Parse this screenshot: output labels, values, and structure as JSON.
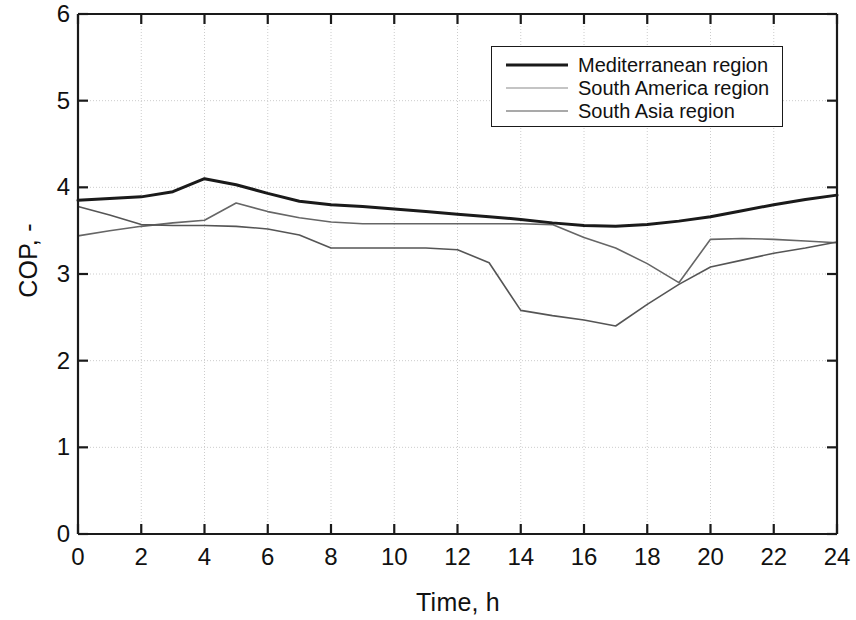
{
  "chart_data": {
    "type": "line",
    "title": "",
    "xlabel": "Time, h",
    "ylabel": "COP, -",
    "xlim": [
      0,
      24
    ],
    "ylim": [
      0,
      6
    ],
    "xticks": [
      "0",
      "2",
      "4",
      "6",
      "8",
      "10",
      "12",
      "14",
      "16",
      "18",
      "20",
      "22",
      "24"
    ],
    "xtick_values": [
      0,
      2,
      4,
      6,
      8,
      10,
      12,
      14,
      16,
      18,
      20,
      22,
      24
    ],
    "yticks": [
      "0",
      "1",
      "2",
      "3",
      "4",
      "5",
      "6"
    ],
    "ytick_values": [
      0,
      1,
      2,
      3,
      4,
      5,
      6
    ],
    "grid": true,
    "grid_color": "#cccccc",
    "legend_position": "top-right",
    "x": [
      0,
      1,
      2,
      3,
      4,
      5,
      6,
      7,
      8,
      9,
      10,
      11,
      12,
      13,
      14,
      15,
      16,
      17,
      18,
      19,
      20,
      21,
      22,
      23,
      24
    ],
    "series": [
      {
        "name": "Mediterranean region",
        "color": "#1a1a1a",
        "width": 3.0,
        "values": [
          3.85,
          3.87,
          3.89,
          3.95,
          4.1,
          4.03,
          3.93,
          3.84,
          3.8,
          3.78,
          3.75,
          3.72,
          3.69,
          3.66,
          3.63,
          3.59,
          3.56,
          3.55,
          3.57,
          3.61,
          3.66,
          3.73,
          3.8,
          3.86,
          3.91
        ]
      },
      {
        "name": "South America region",
        "color": "#666666",
        "width": 1.6,
        "values": [
          3.44,
          3.5,
          3.55,
          3.59,
          3.62,
          3.82,
          3.72,
          3.65,
          3.6,
          3.58,
          3.58,
          3.58,
          3.58,
          3.58,
          3.58,
          3.57,
          3.42,
          3.3,
          3.12,
          2.9,
          3.4,
          3.41,
          3.4,
          3.38,
          3.36
        ]
      },
      {
        "name": "South Asia region",
        "color": "#555555",
        "width": 1.6,
        "values": [
          3.78,
          3.68,
          3.57,
          3.56,
          3.56,
          3.55,
          3.52,
          3.45,
          3.3,
          3.3,
          3.3,
          3.3,
          3.28,
          3.13,
          2.58,
          2.52,
          2.47,
          2.4,
          2.65,
          2.88,
          3.08,
          3.16,
          3.24,
          3.3,
          3.37
        ]
      }
    ],
    "series_order_drawn": [
      {
        "name": "South America region",
        "values": [
          3.44,
          3.5,
          3.55,
          3.59,
          3.62,
          3.82,
          3.72,
          3.65,
          3.6,
          3.58,
          3.58,
          3.58,
          3.58,
          3.58,
          3.58,
          3.57,
          3.42,
          3.3,
          3.12,
          2.9,
          3.4,
          3.41,
          3.4,
          3.38,
          3.36
        ]
      }
    ]
  },
  "legend": {
    "entries": [
      {
        "label": "Mediterranean region",
        "color": "#1a1a1a",
        "width": 3.0
      },
      {
        "label": "South America region",
        "color": "#8a8a8a",
        "width": 1.6
      },
      {
        "label": "South Asia region",
        "color": "#555555",
        "width": 1.6
      }
    ]
  }
}
